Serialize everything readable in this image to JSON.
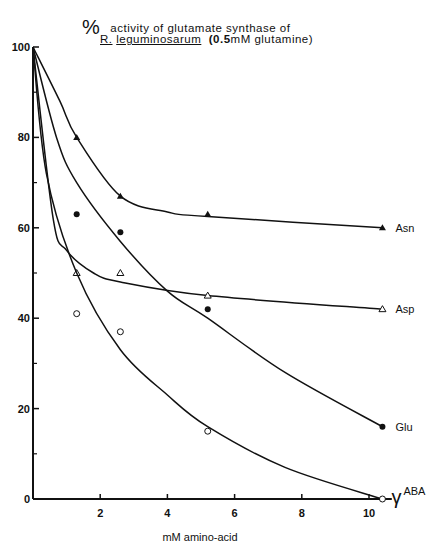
{
  "title": {
    "line1_symbol": "%",
    "line1_text": "activity of glutamate synthase of",
    "line2_organism_initial": "R.",
    "line2_organism": "leguminosarum",
    "line2_condition_value": "(0.5",
    "line2_condition_rest": "mM glutamine)"
  },
  "xlabel": "mM  amino-acid",
  "chart_data": {
    "type": "line",
    "xlabel": "mM amino-acid",
    "ylabel": "% activity",
    "xlim": [
      0,
      10.5
    ],
    "ylim": [
      0,
      100
    ],
    "x_ticks": [
      2,
      4,
      6,
      8,
      10
    ],
    "y_ticks": [
      0,
      20,
      40,
      60,
      80,
      100
    ],
    "y_minor_ticks": [
      10,
      30,
      50,
      70,
      90
    ],
    "grid": false,
    "legend_position": "inline labels at right end of curves",
    "series": [
      {
        "name": "Asn",
        "marker": "filled-triangle",
        "x": [
          0,
          1.3,
          2.6,
          5.2,
          10.4
        ],
        "y": [
          100,
          80,
          67,
          63,
          60
        ]
      },
      {
        "name": "Asp",
        "marker": "open-triangle",
        "x": [
          0,
          1.3,
          2.6,
          5.2,
          10.4
        ],
        "y": [
          100,
          50,
          50,
          45,
          42
        ]
      },
      {
        "name": "Glu",
        "marker": "filled-circle",
        "x": [
          0,
          1.3,
          2.6,
          5.2,
          10.4
        ],
        "y": [
          100,
          63,
          59,
          42,
          16
        ]
      },
      {
        "name": "γABA",
        "marker": "open-circle",
        "x": [
          0,
          1.3,
          2.6,
          5.2,
          10.4
        ],
        "y": [
          100,
          41,
          37,
          15,
          0
        ]
      }
    ]
  }
}
